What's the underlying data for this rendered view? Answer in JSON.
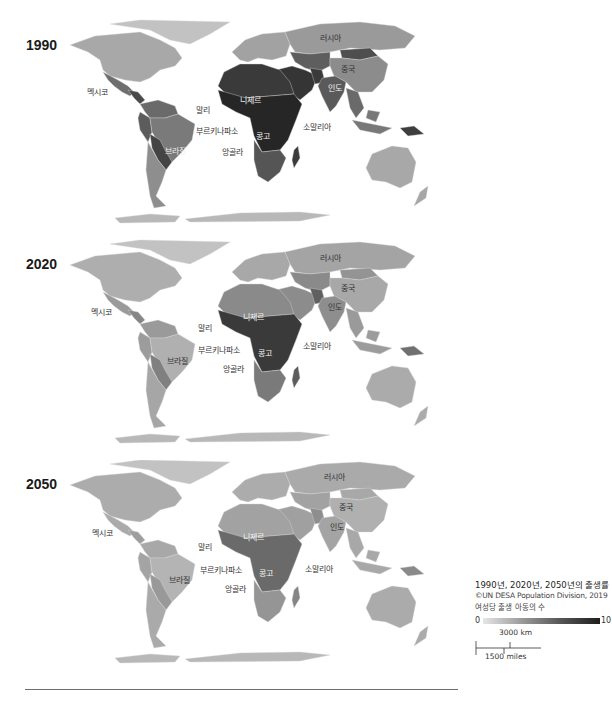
{
  "figure": {
    "panels": [
      {
        "year": "1990",
        "shades": {
          "na": "#a8a8a8",
          "greenland": "#c2c2c2",
          "mexico": "#6e6e6e",
          "central": "#4a4a4a",
          "sa_north": "#6a6a6a",
          "brazil": "#7a7a7a",
          "sa_west": "#5c5c5c",
          "bolivia": "#444444",
          "sa_south": "#8e8e8e",
          "europe": "#a2a2a2",
          "russia": "#9a9a9a",
          "n_africa": "#3a3a3a",
          "sub_africa": "#262626",
          "s_africa": "#555555",
          "mideast": "#353535",
          "c_asia": "#5e5e5e",
          "mongolia": "#4e4e4e",
          "china": "#8c8c8c",
          "india": "#5a5a5a",
          "pakistan": "#3a3a3a",
          "se_asia": "#6a6a6a",
          "indonesia": "#787878",
          "png": "#3e3e3e",
          "australia": "#a8a8a8",
          "nz": "#a6a6a6",
          "madagascar": "#3c3c3c",
          "antarctica": "#b8b8b8"
        }
      },
      {
        "year": "2020",
        "shades": {
          "na": "#aeaeae",
          "greenland": "#c2c2c2",
          "mexico": "#9a9a9a",
          "central": "#868686",
          "sa_north": "#9a9a9a",
          "brazil": "#b0b0b0",
          "sa_west": "#9c9c9c",
          "bolivia": "#808080",
          "sa_south": "#a6a6a6",
          "europe": "#a8a8a8",
          "russia": "#a4a4a4",
          "n_africa": "#8a8a8a",
          "sub_africa": "#3a3a3a",
          "s_africa": "#7a7a7a",
          "mideast": "#8c8c8c",
          "c_asia": "#8a8a8a",
          "mongolia": "#949494",
          "china": "#a8a8a8",
          "india": "#8e8e8e",
          "pakistan": "#606060",
          "se_asia": "#9a9a9a",
          "indonesia": "#9c9c9c",
          "png": "#707070",
          "australia": "#ababab",
          "nz": "#ababab",
          "madagascar": "#5c5c5c",
          "antarctica": "#b8b8b8"
        }
      },
      {
        "year": "2050",
        "shades": {
          "na": "#acacac",
          "greenland": "#c2c2c2",
          "mexico": "#aaaaaa",
          "central": "#9e9e9e",
          "sa_north": "#a8a8a8",
          "brazil": "#b4b4b4",
          "sa_west": "#a4a4a4",
          "bolivia": "#999999",
          "sa_south": "#aaaaaa",
          "europe": "#acacac",
          "russia": "#aaaaaa",
          "n_africa": "#a2a2a2",
          "sub_africa": "#6a6a6a",
          "s_africa": "#959595",
          "mideast": "#a0a0a0",
          "c_asia": "#a2a2a2",
          "mongolia": "#a8a8a8",
          "china": "#b0b0b0",
          "india": "#a4a4a4",
          "pakistan": "#8e8e8e",
          "se_asia": "#a8a8a8",
          "indonesia": "#a8a8a8",
          "png": "#8a8a8a",
          "australia": "#ababab",
          "nz": "#ababab",
          "madagascar": "#858585",
          "antarctica": "#b8b8b8"
        }
      }
    ],
    "labels": {
      "mexico": "멕시코",
      "mali": "말리",
      "niger": "니제르",
      "burkina_faso": "부르키나파소",
      "brazil": "브라질",
      "congo": "콩고",
      "angola": "앙골라",
      "somalia": "소말리아",
      "russia": "러시아",
      "china": "중국",
      "india": "인도"
    },
    "legend": {
      "title": "1990년, 2020년, 2050년의 출생률",
      "source": "©UN DESA Population Division, 2019",
      "unit": "여성당 출생 아동의 수",
      "min": "0",
      "max": "10",
      "colors": {
        "low": "#e6e6e6",
        "high": "#1e1e1e"
      }
    },
    "scale_bar": {
      "km": "3000 km",
      "miles": "1500 miles"
    }
  }
}
